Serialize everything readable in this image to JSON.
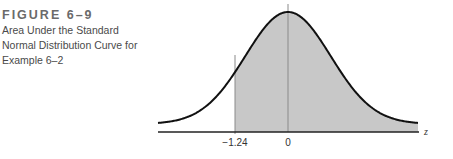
{
  "caption": {
    "figure_label": "FIGURE 6–9",
    "line1": "Area Under the Standard",
    "line2": "Normal Distribution Curve for",
    "line3": "Example 6–2"
  },
  "chart_data": {
    "type": "area",
    "title": "Area Under the Standard Normal Distribution Curve for Example 6–2",
    "distribution": "standard normal",
    "xlabel": "z",
    "ylabel": "",
    "tick_labels": [
      "−1.24",
      "0"
    ],
    "tick_values": [
      -1.24,
      0
    ],
    "shaded_region": {
      "from": -1.24,
      "to": "right tail",
      "color": "#c8c8c8"
    },
    "xlim": [
      -3,
      2.6
    ],
    "grid": false,
    "legend": null
  },
  "axis": {
    "tick_left": "−1.24",
    "tick_zero": "0",
    "variable": "z"
  },
  "colors": {
    "shade": "#c8c8c8",
    "curve": "#111111",
    "guide_line": "#8a8a8a"
  }
}
